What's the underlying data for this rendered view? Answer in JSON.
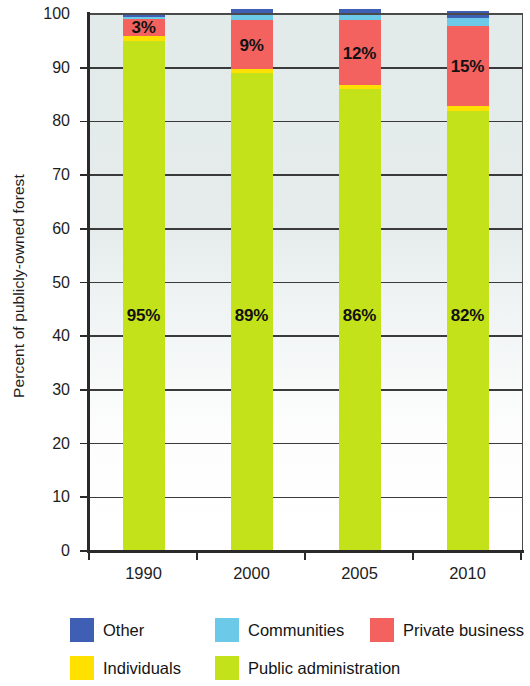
{
  "chart_data": {
    "type": "bar",
    "subtype": "stacked-bar-100",
    "title": "",
    "xlabel": "",
    "ylabel": "Percent of publicly-owned forest",
    "categories": [
      "1990",
      "2000",
      "2005",
      "2010"
    ],
    "ylim": [
      0,
      100
    ],
    "ytick_labels": [
      "0",
      "10",
      "20",
      "30",
      "40",
      "50",
      "60",
      "70",
      "80",
      "90",
      "100"
    ],
    "ytick_values": [
      0,
      10,
      20,
      30,
      40,
      50,
      60,
      70,
      80,
      90,
      100
    ],
    "grid": true,
    "grid_axis": "y",
    "legend_position": "bottom",
    "series": [
      {
        "name": "Public administration",
        "color": "#c3e219",
        "values": [
          95,
          89,
          86,
          82
        ],
        "labels": [
          "95%",
          "89%",
          "86%",
          "82%"
        ]
      },
      {
        "name": "Individuals",
        "color": "#ffe100",
        "values": [
          1,
          0.8,
          0.8,
          0.8
        ],
        "labels": [
          "",
          "",
          "",
          ""
        ]
      },
      {
        "name": "Private business",
        "color": "#f4625f",
        "values": [
          3,
          9,
          12,
          15
        ],
        "labels": [
          "3%",
          "9%",
          "12%",
          "15%"
        ]
      },
      {
        "name": "Communities",
        "color": "#6dc9e8",
        "values": [
          0.4,
          1.0,
          1.0,
          1.4
        ],
        "labels": [
          "",
          "",
          "",
          ""
        ]
      },
      {
        "name": "Other",
        "color": "#3f5fb5",
        "values": [
          0.6,
          1.2,
          1.2,
          1.4
        ],
        "labels": [
          "",
          "",
          "",
          ""
        ]
      }
    ]
  },
  "axis": {
    "y_title": "Percent of publicly-owned forest"
  },
  "legend": {
    "items": [
      {
        "label": "Other",
        "color": "#3f5fb5"
      },
      {
        "label": "Communities",
        "color": "#6dc9e8"
      },
      {
        "label": "Private business",
        "color": "#f4625f"
      },
      {
        "label": "Individuals",
        "color": "#ffe100"
      },
      {
        "label": "Public administration",
        "color": "#c3e219"
      }
    ]
  }
}
